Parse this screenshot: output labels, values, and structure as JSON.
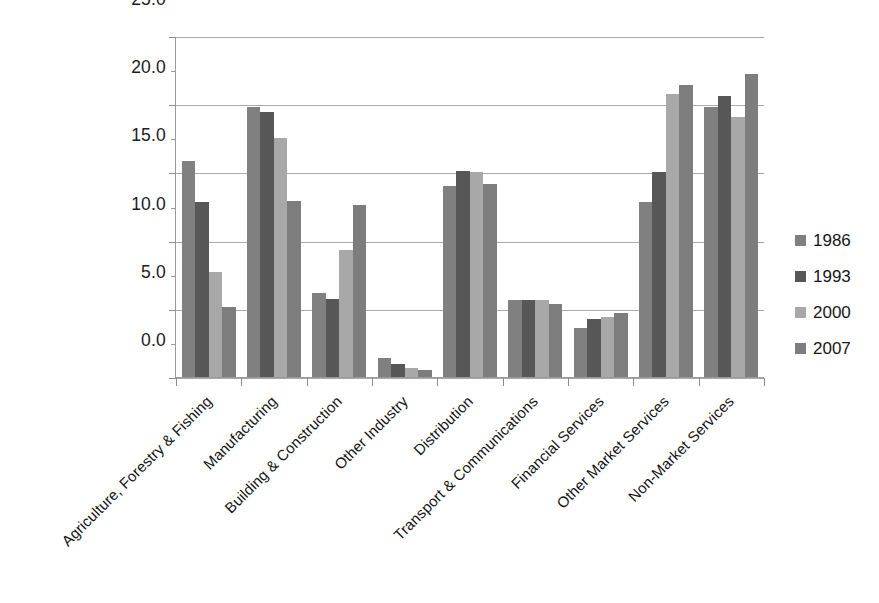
{
  "chart_data": {
    "type": "bar",
    "title": "",
    "subtitle": "",
    "xlabel": "",
    "ylabel": "",
    "ylim": [
      0.0,
      25.0
    ],
    "yticks": [
      "0.0",
      "5.0",
      "10.0",
      "15.0",
      "20.0",
      "25.0"
    ],
    "ytick_values": [
      0.0,
      5.0,
      10.0,
      15.0,
      20.0,
      25.0
    ],
    "grid": true,
    "legend_position": "right",
    "categories": [
      "Agriculture, Forestry & Fishing",
      "Manufacturing",
      "Building & Construction",
      "Other Industry",
      "Distribution",
      "Transport & Communications",
      "Financial Services",
      "Other Market Services",
      "Non-Market Services"
    ],
    "series": [
      {
        "name": "1986",
        "color": "#808080",
        "values": [
          15.9,
          19.9,
          6.2,
          1.5,
          14.1,
          5.7,
          3.7,
          12.9,
          19.9
        ]
      },
      {
        "name": "1993",
        "color": "#575757",
        "values": [
          12.9,
          19.5,
          5.8,
          1.0,
          15.2,
          5.7,
          4.3,
          15.1,
          20.7
        ]
      },
      {
        "name": "2000",
        "color": "#a8a8a8",
        "values": [
          7.8,
          17.6,
          9.4,
          0.7,
          15.1,
          5.7,
          4.5,
          20.8,
          19.1
        ]
      },
      {
        "name": "2007",
        "color": "#7d7d7d",
        "values": [
          5.2,
          13.0,
          12.7,
          0.6,
          14.2,
          5.4,
          4.8,
          21.5,
          22.3
        ]
      }
    ]
  },
  "legend": {
    "entries": [
      {
        "label": "1986",
        "color": "#808080"
      },
      {
        "label": "1993",
        "color": "#575757"
      },
      {
        "label": "2000",
        "color": "#a8a8a8"
      },
      {
        "label": "2007",
        "color": "#7d7d7d"
      }
    ]
  }
}
